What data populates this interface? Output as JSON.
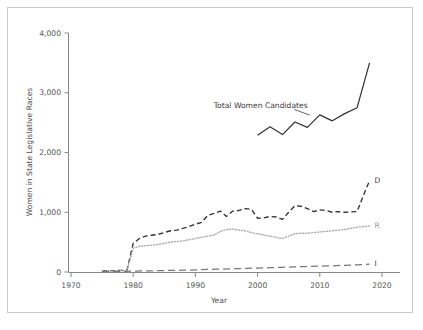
{
  "figure": {
    "frame_color": "#c8c8c8",
    "background": "#ffffff",
    "width": 423,
    "height": 330
  },
  "chart_data": {
    "type": "line",
    "title": "",
    "xlabel": "Year",
    "ylabel": "Women in State Legislative Races",
    "xlim": [
      1968,
      2021
    ],
    "ylim": [
      -60,
      4150
    ],
    "xticks": [
      "1970",
      "1980",
      "1990",
      "2000",
      "2010",
      "2020"
    ],
    "xtick_values": [
      1970,
      1980,
      1990,
      2000,
      2010,
      2020
    ],
    "yticks": [
      "0",
      "1,000",
      "2,000",
      "3,000",
      "4,000"
    ],
    "ytick_values": [
      0,
      1000,
      2000,
      3000,
      4000
    ],
    "grid": false,
    "legend_position": "inline-right-labels",
    "annotations": [
      {
        "text": "Total Women Candidates",
        "x": 2000.5,
        "y": 2740,
        "leader_from_x": 2005.9,
        "leader_from_y": 2720,
        "leader_to_x": 2008.4,
        "leader_to_y": 2625
      }
    ],
    "series": [
      {
        "name": "Total Women Candidates",
        "label": "",
        "style": "solid",
        "color": "#333333",
        "x": [
          2000,
          2002,
          2004,
          2006,
          2008,
          2010,
          2012,
          2014,
          2016,
          2018
        ],
        "values": [
          2290,
          2430,
          2300,
          2510,
          2420,
          2630,
          2530,
          2650,
          2750,
          3500
        ]
      },
      {
        "name": "Democratic",
        "label": "D",
        "style": "dashed",
        "color": "#333333",
        "x": [
          1975,
          1976,
          1977,
          1978,
          1979,
          1980,
          1981,
          1982,
          1983,
          1984,
          1985,
          1986,
          1987,
          1988,
          1989,
          1990,
          1991,
          1992,
          1993,
          1994,
          1995,
          1996,
          1997,
          1998,
          1999,
          2000,
          2001,
          2002,
          2003,
          2004,
          2005,
          2006,
          2007,
          2008,
          2009,
          2010,
          2011,
          2012,
          2013,
          2014,
          2015,
          2016,
          2017,
          2018
        ],
        "values": [
          20,
          22,
          24,
          26,
          30,
          480,
          560,
          600,
          615,
          630,
          660,
          690,
          700,
          730,
          760,
          800,
          830,
          950,
          980,
          1020,
          930,
          1020,
          1030,
          1060,
          1050,
          900,
          905,
          930,
          920,
          880,
          1000,
          1110,
          1100,
          1060,
          1010,
          1040,
          1030,
          1000,
          1010,
          1000,
          1005,
          1010,
          1280,
          1530
        ]
      },
      {
        "name": "Republican",
        "label": "R",
        "style": "dotted",
        "color": "#b0b0b0",
        "x": [
          1975,
          1976,
          1977,
          1978,
          1979,
          1980,
          1981,
          1982,
          1983,
          1984,
          1985,
          1986,
          1987,
          1988,
          1989,
          1990,
          1991,
          1992,
          1993,
          1994,
          1995,
          1996,
          1997,
          1998,
          1999,
          2000,
          2001,
          2002,
          2003,
          2004,
          2005,
          2006,
          2007,
          2008,
          2009,
          2010,
          2011,
          2012,
          2013,
          2014,
          2015,
          2016,
          2017,
          2018
        ],
        "values": [
          15,
          17,
          18,
          20,
          24,
          400,
          430,
          440,
          450,
          460,
          480,
          500,
          510,
          520,
          540,
          560,
          580,
          600,
          620,
          680,
          710,
          720,
          700,
          690,
          660,
          640,
          620,
          600,
          580,
          560,
          600,
          640,
          650,
          650,
          660,
          670,
          680,
          690,
          700,
          710,
          730,
          750,
          760,
          770
        ]
      },
      {
        "name": "Independent/Other",
        "label": "I",
        "style": "longdash",
        "color": "#777777",
        "x": [
          1975,
          1978,
          1980,
          1982,
          1984,
          1986,
          1988,
          1990,
          1992,
          1994,
          1996,
          1998,
          2000,
          2002,
          2004,
          2006,
          2008,
          2010,
          2012,
          2014,
          2016,
          2018
        ],
        "values": [
          8,
          10,
          14,
          18,
          22,
          26,
          30,
          36,
          42,
          48,
          54,
          60,
          66,
          72,
          78,
          86,
          92,
          98,
          104,
          112,
          120,
          130
        ]
      }
    ]
  }
}
